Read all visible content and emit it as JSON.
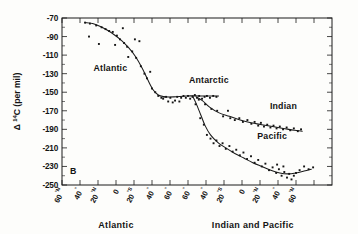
{
  "figure": {
    "panel_label": "B",
    "background_color": "#fdfdfb",
    "ink_color": "#151515"
  },
  "chart_data": {
    "type": "scatter",
    "title": "",
    "subtitle": "",
    "panel": "B",
    "ylabel": "Δ 14C (per mil)",
    "ylabel_parts": {
      "delta": "Δ",
      "sup": "14",
      "rest": "C (per mil)"
    },
    "xlabel_left": "Atlantic",
    "xlabel_right": "Indian and Pacific",
    "grid": false,
    "legend_position": "inline-annotations",
    "ylim": [
      -250,
      -70
    ],
    "ytick_values": [
      -70,
      -90,
      -110,
      -130,
      -150,
      -170,
      -190,
      -210,
      -230,
      -250
    ],
    "ytick_labels": [
      "-70",
      "-90",
      "-110",
      "-130",
      "-150",
      "-170",
      "-190",
      "-210",
      "-230",
      "-250"
    ],
    "ytick_step": 20,
    "y_minor_step": 10,
    "xlim": [
      0,
      15
    ],
    "xtick_positions": [
      0,
      1,
      2,
      3,
      4,
      5,
      6,
      7,
      8,
      9,
      10,
      11,
      12,
      13,
      14
    ],
    "xtick_labels": [
      "60°N",
      "40°",
      "20°N",
      "0",
      "20°S",
      "40°",
      "60°",
      "60°",
      "40°",
      "20°S",
      "0",
      "20°N",
      "40°",
      "60°N"
    ],
    "xtick_label_bases": [
      "60",
      "40",
      "20",
      "0",
      "20",
      "40",
      "60",
      "60",
      "40",
      "20",
      "0",
      "20",
      "40",
      "60"
    ],
    "xtick_label_sups": [
      "°N",
      "°",
      "°N",
      "",
      "°S",
      "°",
      "°",
      "°",
      "°",
      "°S",
      "",
      "°N",
      "°",
      "°N"
    ],
    "annotations": [
      {
        "text": "Atlantic",
        "x": 1.75,
        "y": -127
      },
      {
        "text": "Antarctic",
        "x": 7.05,
        "y": -140
      },
      {
        "text": "Indian",
        "x": 11.55,
        "y": -168
      },
      {
        "text": "Pacific",
        "x": 10.85,
        "y": -200
      },
      {
        "text": "B",
        "x": 0.45,
        "y": -238
      }
    ],
    "series": [
      {
        "name": "Atlantic",
        "label_text": "Atlantic",
        "fit": [
          [
            1.3,
            -75
          ],
          [
            1.7,
            -76
          ],
          [
            2.1,
            -79
          ],
          [
            2.5,
            -83
          ],
          [
            2.9,
            -88
          ],
          [
            3.3,
            -94
          ],
          [
            3.7,
            -102
          ],
          [
            4.1,
            -112
          ],
          [
            4.45,
            -124
          ],
          [
            4.75,
            -136
          ],
          [
            5.05,
            -147
          ],
          [
            5.35,
            -153
          ],
          [
            5.7,
            -155
          ]
        ],
        "points": [
          [
            1.28,
            -75
          ],
          [
            1.5,
            -90
          ],
          [
            1.55,
            -76
          ],
          [
            1.9,
            -78
          ],
          [
            2.05,
            -98
          ],
          [
            2.2,
            -80
          ],
          [
            2.42,
            -82
          ],
          [
            2.62,
            -84
          ],
          [
            2.82,
            -85
          ],
          [
            2.95,
            -99
          ],
          [
            3.05,
            -89
          ],
          [
            3.22,
            -93
          ],
          [
            3.38,
            -81
          ],
          [
            3.45,
            -97
          ],
          [
            3.62,
            -101
          ],
          [
            3.68,
            -112
          ],
          [
            3.9,
            -106
          ],
          [
            4.05,
            -93
          ],
          [
            4.12,
            -113
          ],
          [
            4.3,
            -95
          ],
          [
            4.38,
            -122
          ],
          [
            4.58,
            -130
          ],
          [
            4.72,
            -135
          ],
          [
            4.9,
            -128
          ],
          [
            5.0,
            -146
          ],
          [
            5.18,
            -150
          ],
          [
            5.35,
            -154
          ],
          [
            5.52,
            -156
          ]
        ]
      },
      {
        "name": "Antarctic",
        "label_text": "Antarctic",
        "fit": [
          [
            5.6,
            -155
          ],
          [
            6.2,
            -155
          ],
          [
            6.9,
            -154
          ],
          [
            7.6,
            -154
          ],
          [
            8.2,
            -154
          ],
          [
            8.7,
            -154
          ]
        ],
        "points": [
          [
            5.62,
            -157
          ],
          [
            5.78,
            -155
          ],
          [
            5.9,
            -160
          ],
          [
            6.02,
            -156
          ],
          [
            6.15,
            -161
          ],
          [
            6.28,
            -159
          ],
          [
            6.4,
            -155
          ],
          [
            6.52,
            -160
          ],
          [
            6.62,
            -156
          ],
          [
            6.75,
            -154
          ],
          [
            6.88,
            -156
          ],
          [
            7.0,
            -154
          ],
          [
            7.12,
            -157
          ],
          [
            7.25,
            -155
          ],
          [
            7.38,
            -153
          ],
          [
            7.5,
            -156
          ],
          [
            7.62,
            -154
          ],
          [
            7.78,
            -157
          ],
          [
            7.92,
            -155
          ],
          [
            8.05,
            -154
          ],
          [
            8.22,
            -156
          ],
          [
            8.4,
            -154
          ],
          [
            8.58,
            -155
          ]
        ]
      },
      {
        "name": "Indian",
        "label_text": "Indian",
        "fit": [
          [
            7.45,
            -155
          ],
          [
            7.8,
            -159
          ],
          [
            8.2,
            -166
          ],
          [
            8.7,
            -172
          ],
          [
            9.3,
            -176
          ],
          [
            9.9,
            -180
          ],
          [
            10.5,
            -183
          ],
          [
            11.1,
            -185
          ],
          [
            11.7,
            -187
          ],
          [
            12.3,
            -189
          ],
          [
            12.9,
            -191
          ],
          [
            13.35,
            -192
          ]
        ],
        "points": [
          [
            7.6,
            -158
          ],
          [
            7.95,
            -163
          ],
          [
            8.3,
            -168
          ],
          [
            8.62,
            -170
          ],
          [
            8.95,
            -176
          ],
          [
            9.22,
            -170
          ],
          [
            9.35,
            -178
          ],
          [
            9.6,
            -180
          ],
          [
            9.85,
            -178
          ],
          [
            10.05,
            -182
          ],
          [
            10.3,
            -180
          ],
          [
            10.52,
            -184
          ],
          [
            10.7,
            -182
          ],
          [
            10.9,
            -186
          ],
          [
            11.05,
            -183
          ],
          [
            11.22,
            -187
          ],
          [
            11.4,
            -185
          ],
          [
            11.58,
            -188
          ],
          [
            11.75,
            -186
          ],
          [
            11.92,
            -189
          ],
          [
            12.1,
            -187
          ],
          [
            12.28,
            -190
          ],
          [
            12.48,
            -188
          ],
          [
            12.68,
            -191
          ],
          [
            12.88,
            -189
          ],
          [
            13.1,
            -192
          ],
          [
            13.28,
            -190
          ]
        ]
      },
      {
        "name": "Pacific",
        "label_text": "Pacific",
        "fit": [
          [
            7.25,
            -154
          ],
          [
            7.45,
            -162
          ],
          [
            7.7,
            -174
          ],
          [
            7.95,
            -186
          ],
          [
            8.25,
            -196
          ],
          [
            8.65,
            -204
          ],
          [
            9.1,
            -210
          ],
          [
            9.6,
            -216
          ],
          [
            10.1,
            -221
          ],
          [
            10.6,
            -226
          ],
          [
            11.1,
            -230
          ],
          [
            11.6,
            -234
          ],
          [
            12.1,
            -237
          ],
          [
            12.55,
            -238
          ],
          [
            13.0,
            -237
          ],
          [
            13.45,
            -235
          ],
          [
            13.85,
            -233
          ]
        ],
        "points": [
          [
            7.42,
            -163
          ],
          [
            7.68,
            -178
          ],
          [
            7.88,
            -185
          ],
          [
            8.05,
            -196
          ],
          [
            8.25,
            -200
          ],
          [
            8.42,
            -205
          ],
          [
            8.58,
            -202
          ],
          [
            8.75,
            -208
          ],
          [
            8.92,
            -205
          ],
          [
            9.1,
            -211
          ],
          [
            9.3,
            -208
          ],
          [
            9.48,
            -214
          ],
          [
            9.68,
            -212
          ],
          [
            9.88,
            -218
          ],
          [
            10.08,
            -215
          ],
          [
            10.28,
            -222
          ],
          [
            10.5,
            -219
          ],
          [
            10.7,
            -226
          ],
          [
            10.9,
            -223
          ],
          [
            11.1,
            -230
          ],
          [
            11.3,
            -227
          ],
          [
            11.5,
            -234
          ],
          [
            11.7,
            -231
          ],
          [
            11.9,
            -237
          ],
          [
            12.05,
            -233
          ],
          [
            12.2,
            -240
          ],
          [
            12.35,
            -236
          ],
          [
            12.5,
            -242
          ],
          [
            12.62,
            -238
          ],
          [
            12.75,
            -244
          ],
          [
            12.88,
            -240
          ],
          [
            13.0,
            -237
          ],
          [
            13.2,
            -234
          ],
          [
            13.45,
            -230
          ],
          [
            13.7,
            -233
          ],
          [
            13.95,
            -231
          ],
          [
            12.3,
            -230
          ],
          [
            11.95,
            -228
          ]
        ]
      }
    ]
  }
}
